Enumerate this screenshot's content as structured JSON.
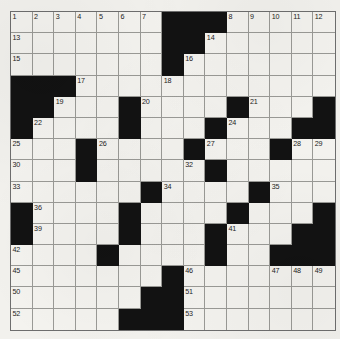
{
  "puzzle": {
    "name": "crossword-grid",
    "rows": 15,
    "cols": 15,
    "cell_size_px": 21.6,
    "colors": {
      "paper": "#f2f1ed",
      "cell_fill": "#f4f3ef",
      "block_fill": "#121212",
      "grid_line": "#9a9a96",
      "number_text": "#1c1c1c"
    },
    "legend": {
      "block_char": "#",
      "open_char": "."
    },
    "grid": [
      ".......###.....",
      ".......##......",
      ".......#.......",
      "###............",
      "##...#....#...#",
      "#....#...#...##",
      "...#....#...#..",
      "...#.....#.....",
      "......#....#...",
      "#....#....#...#",
      "#....#...#...##",
      "....#....#..###",
      ".......#.......",
      "......##.......",
      ".....###......."
    ],
    "numbers": [
      {
        "n": 1,
        "row": 1,
        "col": 1
      },
      {
        "n": 2,
        "row": 1,
        "col": 2
      },
      {
        "n": 3,
        "row": 1,
        "col": 3
      },
      {
        "n": 4,
        "row": 1,
        "col": 4
      },
      {
        "n": 5,
        "row": 1,
        "col": 5
      },
      {
        "n": 6,
        "row": 1,
        "col": 6
      },
      {
        "n": 7,
        "row": 1,
        "col": 7
      },
      {
        "n": 8,
        "row": 1,
        "col": 11
      },
      {
        "n": 9,
        "row": 1,
        "col": 12
      },
      {
        "n": 10,
        "row": 1,
        "col": 13
      },
      {
        "n": 11,
        "row": 1,
        "col": 14
      },
      {
        "n": 12,
        "row": 1,
        "col": 15
      },
      {
        "n": 13,
        "row": 2,
        "col": 1
      },
      {
        "n": 14,
        "row": 2,
        "col": 10
      },
      {
        "n": 15,
        "row": 3,
        "col": 1
      },
      {
        "n": 16,
        "row": 3,
        "col": 9
      },
      {
        "n": 17,
        "row": 4,
        "col": 4
      },
      {
        "n": 18,
        "row": 4,
        "col": 8
      },
      {
        "n": 19,
        "row": 5,
        "col": 3
      },
      {
        "n": 20,
        "row": 5,
        "col": 7
      },
      {
        "n": 21,
        "row": 5,
        "col": 12
      },
      {
        "n": 22,
        "row": 6,
        "col": 2
      },
      {
        "n": 23,
        "row": 6,
        "col": 6
      },
      {
        "n": 24,
        "row": 6,
        "col": 11
      },
      {
        "n": 25,
        "row": 7,
        "col": 1
      },
      {
        "n": 26,
        "row": 7,
        "col": 5
      },
      {
        "n": 27,
        "row": 7,
        "col": 10
      },
      {
        "n": 28,
        "row": 7,
        "col": 14
      },
      {
        "n": 29,
        "row": 7,
        "col": 15
      },
      {
        "n": 30,
        "row": 8,
        "col": 1
      },
      {
        "n": 31,
        "row": 8,
        "col": 4
      },
      {
        "n": 32,
        "row": 8,
        "col": 9
      },
      {
        "n": 33,
        "row": 9,
        "col": 1
      },
      {
        "n": 34,
        "row": 9,
        "col": 8
      },
      {
        "n": 35,
        "row": 9,
        "col": 13
      },
      {
        "n": 36,
        "row": 10,
        "col": 2
      },
      {
        "n": 37,
        "row": 10,
        "col": 6
      },
      {
        "n": 38,
        "row": 10,
        "col": 11
      },
      {
        "n": 39,
        "row": 11,
        "col": 2
      },
      {
        "n": 40,
        "row": 11,
        "col": 6
      },
      {
        "n": 41,
        "row": 11,
        "col": 11
      },
      {
        "n": 42,
        "row": 12,
        "col": 1
      },
      {
        "n": 43,
        "row": 12,
        "col": 5
      },
      {
        "n": 44,
        "row": 12,
        "col": 10
      },
      {
        "n": 45,
        "row": 13,
        "col": 1
      },
      {
        "n": 46,
        "row": 13,
        "col": 9
      },
      {
        "n": 47,
        "row": 13,
        "col": 13
      },
      {
        "n": 48,
        "row": 13,
        "col": 14
      },
      {
        "n": 49,
        "row": 13,
        "col": 15
      },
      {
        "n": 50,
        "row": 14,
        "col": 1
      },
      {
        "n": 51,
        "row": 14,
        "col": 9
      },
      {
        "n": 52,
        "row": 15,
        "col": 1
      },
      {
        "n": 53,
        "row": 15,
        "col": 9
      }
    ]
  }
}
